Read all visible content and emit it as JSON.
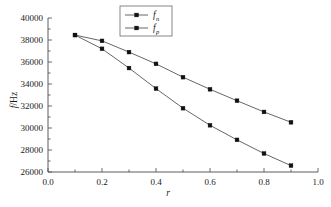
{
  "chart_data": {
    "type": "line",
    "title": "",
    "xlabel": "r",
    "ylabel": "f/Hz",
    "xlim": [
      0.0,
      1.0
    ],
    "ylim": [
      26000,
      40000
    ],
    "grid": false,
    "legend_position": "top-center",
    "x": [
      0.1,
      0.2,
      0.3,
      0.4,
      0.5,
      0.6,
      0.7,
      0.8,
      0.9
    ],
    "series": [
      {
        "name": "f",
        "subscript": "n",
        "label_full": "fn",
        "marker": "square",
        "values": [
          38450,
          37920,
          36900,
          35830,
          34620,
          33520,
          32480,
          31460,
          30520
        ]
      },
      {
        "name": "f",
        "subscript": "p",
        "label_full": "fp",
        "marker": "square",
        "values": [
          38450,
          37200,
          35450,
          33580,
          31800,
          30250,
          28920,
          27680,
          26580
        ]
      }
    ],
    "xticks": [
      0.0,
      0.2,
      0.4,
      0.6,
      0.8,
      1.0
    ],
    "xtick_labels": [
      "0.0",
      "0.2",
      "0.4",
      "0.6",
      "0.8",
      "1.0"
    ],
    "xminor_ticks": [
      0.1,
      0.3,
      0.5,
      0.7,
      0.9
    ],
    "yticks": [
      26000,
      28000,
      30000,
      32000,
      34000,
      36000,
      38000,
      40000
    ],
    "ytick_labels": [
      "26000",
      "28000",
      "30000",
      "32000",
      "34000",
      "36000",
      "38000",
      "40000"
    ],
    "colors": {
      "line": "#555555",
      "marker": "#111111",
      "axis": "#4a4a4a",
      "background": "#ffffff"
    }
  }
}
